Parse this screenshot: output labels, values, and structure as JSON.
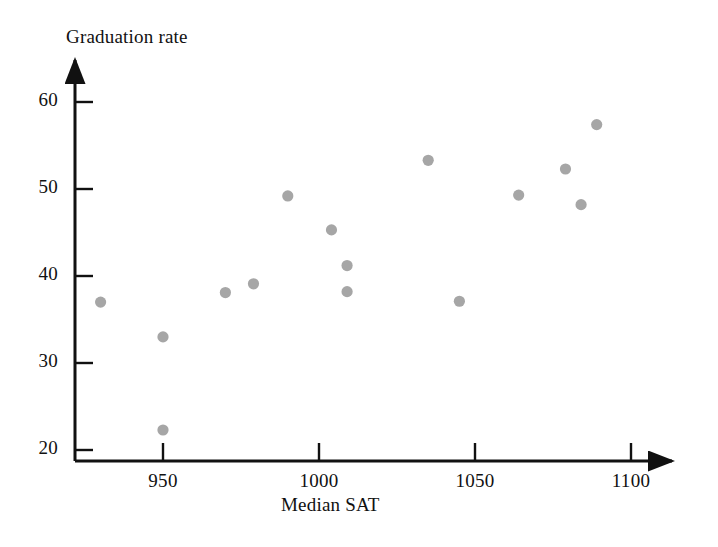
{
  "chart_data": {
    "type": "scatter",
    "title": "",
    "xlabel": "Median SAT",
    "ylabel": "Graduation rate",
    "xlim": [
      925,
      1110
    ],
    "ylim": [
      20,
      62
    ],
    "xticks": [
      950,
      1000,
      1050,
      1100
    ],
    "yticks": [
      20,
      30,
      40,
      50,
      60
    ],
    "xtick_labels": [
      "950",
      "1000",
      "1050",
      "1100"
    ],
    "ytick_labels": [
      "20",
      "30",
      "40",
      "50",
      "60"
    ],
    "grid": false,
    "legend": null,
    "marker_color": "#a6a6a6",
    "axis_color": "#111111",
    "points": [
      {
        "x": 930,
        "y": 37.0
      },
      {
        "x": 950,
        "y": 33.0
      },
      {
        "x": 950,
        "y": 22.3
      },
      {
        "x": 970,
        "y": 38.1
      },
      {
        "x": 979,
        "y": 39.1
      },
      {
        "x": 990,
        "y": 49.2
      },
      {
        "x": 1004,
        "y": 45.3
      },
      {
        "x": 1009,
        "y": 41.2
      },
      {
        "x": 1009,
        "y": 38.2
      },
      {
        "x": 1035,
        "y": 53.3
      },
      {
        "x": 1045,
        "y": 37.1
      },
      {
        "x": 1064,
        "y": 49.3
      },
      {
        "x": 1079,
        "y": 52.3
      },
      {
        "x": 1084,
        "y": 48.2
      },
      {
        "x": 1089,
        "y": 57.4
      }
    ]
  },
  "axes": {
    "y_title": "Graduation rate",
    "x_title": "Median SAT"
  }
}
